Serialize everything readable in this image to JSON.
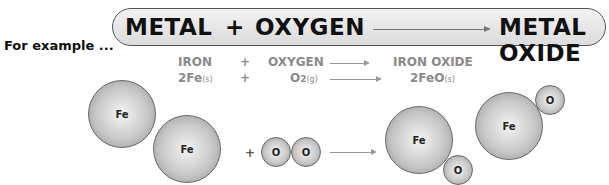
{
  "banner": {
    "reactant1": "METAL",
    "plus": "+",
    "reactant2": "OXYGEN",
    "product": "METAL OXIDE"
  },
  "example_label": "For example ...",
  "word_equation": {
    "reactant1": "IRON",
    "plus": "+",
    "reactant2": "OXYGEN",
    "product": "IRON OXIDE"
  },
  "symbol_equation": {
    "reactant1": "2Fe",
    "reactant1_state": "(s)",
    "plus": "+",
    "reactant2": "O",
    "reactant2_sub": "2",
    "reactant2_state": "(g)",
    "product": "2FeO",
    "product_state": "(s)"
  },
  "atoms": {
    "iron": "Fe",
    "oxygen": "O",
    "plus": "+"
  }
}
